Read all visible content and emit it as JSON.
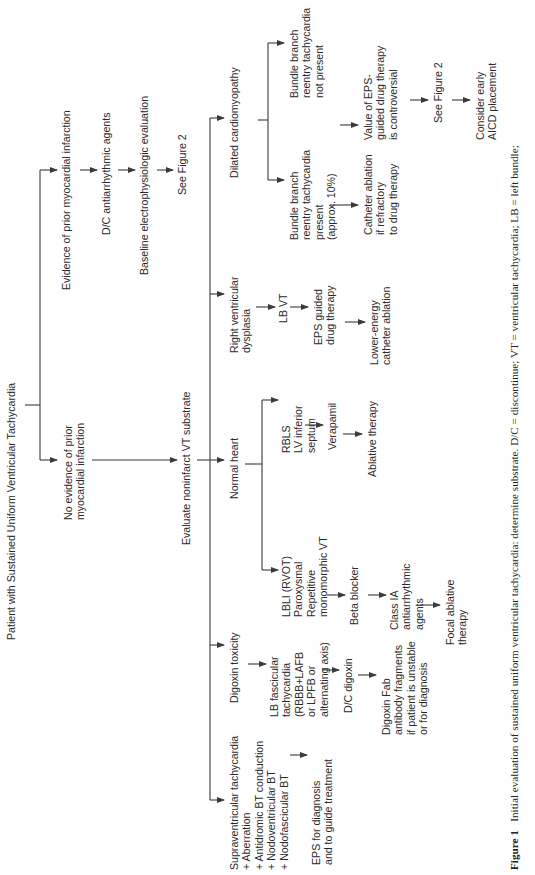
{
  "figure": {
    "title": "Patient with Sustained Uniform Ventricular Tachycardia",
    "branches": {
      "prior_mi": {
        "label": "Evidence of prior myocardial infarction",
        "steps": [
          "D/C antiarrhythmic agents",
          "Baseline electrophysiologic evaluation",
          "See Figure 2"
        ]
      },
      "no_prior_mi": {
        "label": "No evidence of prior\nmyocardial infarction",
        "next": "Evaluate noninfarct VT substrate"
      }
    },
    "substrates": [
      {
        "label": "Dilated cardiomyopathy",
        "sub": [
          {
            "label": "Bundle branch\nreentry tachycardia\npresent\n(approx. 10%)",
            "steps": [
              "Catheter ablation\nif refractory\nto drug therapy"
            ]
          },
          {
            "label": "Bundle branch\nreentry tachycardia\nnot present",
            "steps": [
              "Value of EPS-\nguided drug therapy\nis controversial",
              "See Figure 2",
              "Consider early\nAICD placement"
            ]
          }
        ]
      },
      {
        "label": "Right ventricular\ndysplasia",
        "steps": [
          "LB VT",
          "EPS guided\ndrug therapy",
          "Lower-energy\ncatheter ablation"
        ]
      },
      {
        "label": "Normal heart",
        "sub": [
          {
            "label": "RBLS\nLV inferior\nseptum",
            "steps": [
              "Verapamil",
              "Ablative therapy"
            ]
          },
          {
            "label": "LBLI (RVOT)\nParoxysmal\nRepetitive\nmonomorphic VT",
            "steps": [
              "Beta blocker",
              "Class IA\nantiarrhythmic\nagents",
              "Focal ablative\ntherapy"
            ]
          }
        ]
      },
      {
        "label": "Digoxin toxicity",
        "steps": [
          "LB fascicular\ntachycardia\n(RBBB+LAFB\nor LPFB or\nalternating axis)",
          "D/C digoxin",
          "Digoxin Fab\nantibody fragments\nif patient is unstable\nor for diagnosis"
        ]
      },
      {
        "label": "Supraventricular tachycardia\n+ Aberration\n+ Antidromic BT conduction\n+ Nodoventricular BT\n+ Nodofascicular BT",
        "steps": [
          "EPS for diagnosis\nand to guide treatment"
        ]
      }
    ],
    "caption": {
      "label": "Figure 1",
      "text": "Initial evaluation of sustained uniform ventricular tachycardia: determine substrate. D/C = discontinue; VT = ventricular tachycardia; LB = left bundle;"
    },
    "colors": {
      "line": "#3a3a3a",
      "text": "#2a2a2a",
      "background": "#ffffff"
    }
  }
}
